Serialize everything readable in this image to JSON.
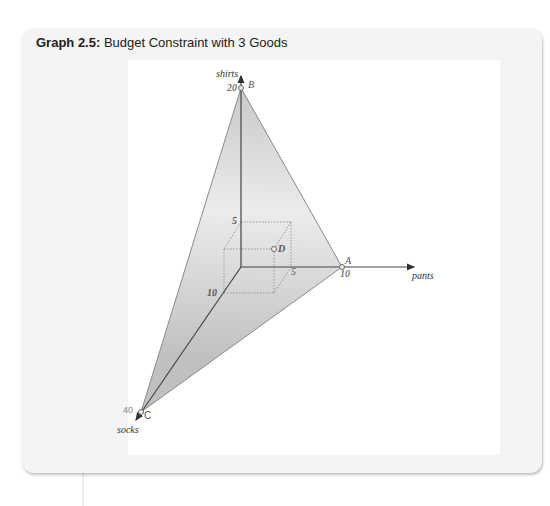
{
  "figure": {
    "title_prefix": "Graph 2.5:",
    "title_text": "Budget Constraint with 3 Goods"
  },
  "axes": {
    "vertical_label": "shirts",
    "horizontal_label": "pants",
    "depth_label": "socks"
  },
  "points": {
    "A": {
      "label": "A",
      "value_label": "10"
    },
    "B": {
      "label": "B",
      "value_label": "20"
    },
    "C": {
      "label": "C",
      "value_label": "40"
    },
    "D": {
      "label": "D"
    }
  },
  "box_ticks": {
    "shirts": "5",
    "pants": "5",
    "socks": "10"
  },
  "colors": {
    "panel_bg": "#f4f4f4",
    "plane_fill_dark": "#c4c4c4",
    "plane_fill_light": "#f0f0f0",
    "axis": "#444444",
    "label_gray": "#777777"
  }
}
